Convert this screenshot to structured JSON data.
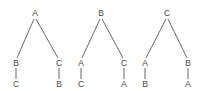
{
  "diagram": {
    "type": "tree-permutations",
    "line_color": "#555555",
    "text_color": "#444444",
    "trees": [
      {
        "root": {
          "label": "A",
          "x": 35,
          "y": 15
        },
        "left": {
          "label": "B",
          "x": 16,
          "y": 63,
          "child": {
            "label": "C",
            "x": 16,
            "y": 84
          }
        },
        "right": {
          "label": "C",
          "x": 59,
          "y": 63,
          "child": {
            "label": "B",
            "x": 59,
            "y": 84
          }
        }
      },
      {
        "root": {
          "label": "B",
          "x": 101,
          "y": 15
        },
        "left": {
          "label": "A",
          "x": 81,
          "y": 63,
          "child": {
            "label": "C",
            "x": 81,
            "y": 84
          }
        },
        "right": {
          "label": "C",
          "x": 124,
          "y": 63,
          "child": {
            "label": "A",
            "x": 124,
            "y": 84
          }
        }
      },
      {
        "root": {
          "label": "C",
          "x": 167,
          "y": 15
        },
        "left": {
          "label": "A",
          "x": 145,
          "y": 63,
          "child": {
            "label": "B",
            "x": 145,
            "y": 84
          }
        },
        "right": {
          "label": "B",
          "x": 188,
          "y": 63,
          "child": {
            "label": "A",
            "x": 188,
            "y": 84
          }
        }
      }
    ]
  }
}
